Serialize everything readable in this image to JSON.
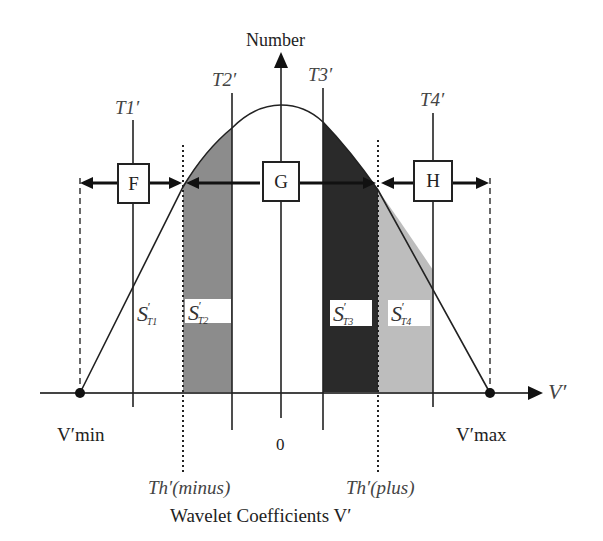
{
  "diagram": {
    "y_axis_label": "Number",
    "x_axis_symbol": "V′",
    "x_axis_title": "Wavelet Coefficients V′",
    "origin_label": "0",
    "v_min_label": "V′min",
    "v_max_label": "V′max",
    "threshold_minus_label": "Th′(minus)",
    "threshold_plus_label": "Th′(plus)",
    "thresholds": [
      {
        "id": "T1",
        "label": "T1′"
      },
      {
        "id": "T2",
        "label": "T2′"
      },
      {
        "id": "T3",
        "label": "T3′"
      },
      {
        "id": "T4",
        "label": "T4′"
      }
    ],
    "regions": [
      {
        "id": "F",
        "label": "F"
      },
      {
        "id": "G",
        "label": "G"
      },
      {
        "id": "H",
        "label": "H"
      }
    ],
    "areas": [
      {
        "id": "S1",
        "symbol": "S",
        "prime": "′",
        "subscript": "T1",
        "fill": "none"
      },
      {
        "id": "S2",
        "symbol": "S",
        "prime": "′",
        "subscript": "T2",
        "fill": "#8c8c8c"
      },
      {
        "id": "S3",
        "symbol": "S",
        "prime": "′",
        "subscript": "T3",
        "fill": "#2a2a2a"
      },
      {
        "id": "S4",
        "symbol": "S",
        "prime": "′",
        "subscript": "T4",
        "fill": "#bdbdbd"
      }
    ],
    "colors": {
      "line": "#222222",
      "background": "#ffffff"
    }
  }
}
